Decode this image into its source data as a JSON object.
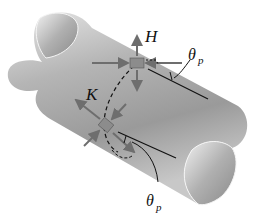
{
  "figure": {
    "labels": {
      "point_h": "H",
      "point_k": "K",
      "angle_top": "θ",
      "angle_top_sub": "p",
      "angle_bottom": "θ",
      "angle_bottom_sub": "p"
    },
    "colors": {
      "tube_light": "#d9d9d9",
      "tube_mid": "#a8a8a8",
      "tube_dark": "#7a7a7a",
      "element_fill": "#8c8c8c",
      "arrow": "#6e6e6e",
      "line": "#111111",
      "background": "#ffffff"
    }
  }
}
